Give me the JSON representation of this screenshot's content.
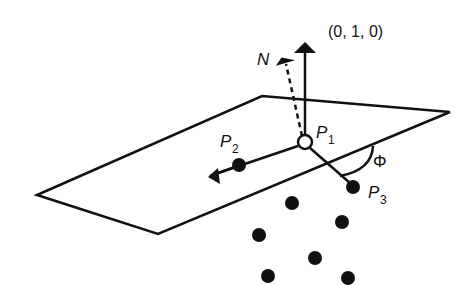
{
  "labels": {
    "up_vector": "(0, 1, 0)",
    "normal": "N",
    "p1": "P",
    "p1_sub": "1",
    "p2": "P",
    "p2_sub": "2",
    "p3": "P",
    "p3_sub": "3",
    "angle": "Φ"
  },
  "colors": {
    "stroke": "#111111",
    "background": "#ffffff"
  },
  "point_cloud_count": 6
}
